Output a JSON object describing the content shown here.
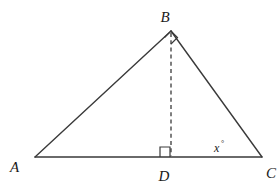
{
  "figure": {
    "background_color": "#ffffff",
    "stroke_color": "#3a3a3a",
    "labels": {
      "vertex_a": "A",
      "vertex_b": "B",
      "vertex_c": "C",
      "foot_d": "D",
      "angle_c_value": "x",
      "angle_c_degree": "°"
    },
    "markers": {
      "right_angle_at_d": "right-angle-square",
      "right_angle_at_b": "right-angle-square-rotated"
    },
    "geometry": {
      "point_a": [
        35,
        157
      ],
      "point_b": [
        171,
        31
      ],
      "point_c": [
        262,
        157
      ],
      "point_d": [
        171,
        157
      ],
      "segment_ab": "solid",
      "segment_bc": "solid",
      "segment_ac": "solid",
      "segment_bd": "dashed"
    }
  }
}
